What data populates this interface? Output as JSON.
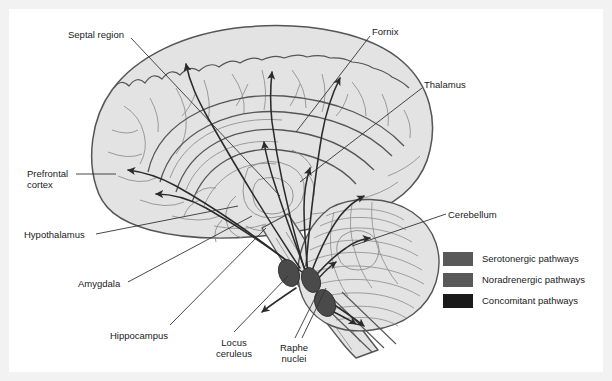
{
  "figure": {
    "type": "anatomical-diagram",
    "background_color": "#ffffff",
    "frame_color": "#f2f2f2",
    "brain_fill": "#e3e3e3",
    "brain_outline": "#555555",
    "sulci_color": "#8c8c8c",
    "pathway_color": "#2b2b2b",
    "leader_color": "#333333",
    "nuclei_fill": "#4a4a4a"
  },
  "labels": [
    {
      "id": "septal-region",
      "text": "Septal region",
      "x": 68,
      "y": 29,
      "align": "left"
    },
    {
      "id": "fornix",
      "text": "Fornix",
      "x": 372,
      "y": 26,
      "align": "left"
    },
    {
      "id": "thalamus",
      "text": "Thalamus",
      "x": 424,
      "y": 79,
      "align": "left"
    },
    {
      "id": "prefrontal-cortex",
      "text": "Prefrontal\ncortex",
      "x": 27,
      "y": 168,
      "align": "left"
    },
    {
      "id": "hypothalamus",
      "text": "Hypothalamus",
      "x": 24,
      "y": 229,
      "align": "left"
    },
    {
      "id": "amygdala",
      "text": "Amygdala",
      "x": 78,
      "y": 278,
      "align": "left"
    },
    {
      "id": "hippocampus",
      "text": "Hippocampus",
      "x": 110,
      "y": 330,
      "align": "left"
    },
    {
      "id": "locus-ceruleus",
      "text": "Locus\nceruleus",
      "x": 222,
      "y": 337,
      "align": "center"
    },
    {
      "id": "raphe-nuclei",
      "text": "Raphe\nnuclei",
      "x": 285,
      "y": 342,
      "align": "center"
    },
    {
      "id": "cerebellum",
      "text": "Cerebellum",
      "x": 448,
      "y": 209,
      "align": "left"
    }
  ],
  "legend": {
    "items": [
      {
        "label": "Serotonergic pathways",
        "color": "#595959",
        "swatch_name": "serotonergic-swatch"
      },
      {
        "label": "Noradrenergic pathways",
        "color": "#595959",
        "swatch_name": "noradrenergic-swatch"
      },
      {
        "label": "Concomitant pathways",
        "color": "#1a1a1a",
        "swatch_name": "concomitant-swatch"
      }
    ]
  },
  "nuclei": [
    {
      "name": "locus-ceruleus-left",
      "cx": 289,
      "cy": 273,
      "rx": 10,
      "ry": 14,
      "rot": -22
    },
    {
      "name": "locus-ceruleus-right",
      "cx": 311,
      "cy": 280,
      "rx": 9,
      "ry": 13,
      "rot": -22
    },
    {
      "name": "raphe-nucleus",
      "cx": 325,
      "cy": 303,
      "rx": 10,
      "ry": 14,
      "rot": -22
    }
  ]
}
